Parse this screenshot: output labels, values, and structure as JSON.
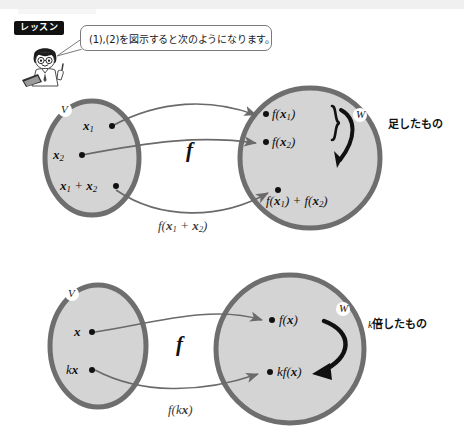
{
  "header": {
    "lesson_badge": "レッスン",
    "speech_bubble": "(1),(2)を図示すると次のようになります。",
    "character_icon": "student-with-laptop-icon"
  },
  "diagrams": [
    {
      "id": "additivity",
      "domain_set": {
        "name": "V",
        "points": [
          {
            "label": "x₁",
            "base": "x",
            "sub": "1"
          },
          {
            "label": "x₂",
            "base": "x",
            "sub": "2"
          },
          {
            "label": "x₁ + x₂",
            "base": "x",
            "sub": "1"
          }
        ]
      },
      "codomain_set": {
        "name": "W",
        "points": [
          {
            "label": "f(x₁)"
          },
          {
            "label": "f(x₂)"
          },
          {
            "label": "f(x₁) + f(x₂)"
          }
        ]
      },
      "map_label": "f",
      "edge_label": "f(x₁ + x₂)",
      "annotation": "足したもの",
      "brace_icon": "curly-brace-icon",
      "result_arrow_icon": "bold-curved-arrow-icon"
    },
    {
      "id": "homogeneity",
      "domain_set": {
        "name": "V",
        "points": [
          {
            "label": "x"
          },
          {
            "label": "kx"
          }
        ]
      },
      "codomain_set": {
        "name": "W",
        "points": [
          {
            "label": "f(x)"
          },
          {
            "label": "kf(x)"
          }
        ]
      },
      "map_label": "f",
      "edge_label": "f(kx)",
      "annotation_prefix": "k",
      "annotation": "倍したもの",
      "result_arrow_icon": "bold-curved-arrow-icon"
    }
  ],
  "colors": {
    "set_fill": "#d4d4d4",
    "set_ring": "#6e6e6e",
    "arrow_gray": "#6a6a6a",
    "arrow_black": "#101010",
    "badge_bg": "#111111",
    "text": "#111111"
  }
}
